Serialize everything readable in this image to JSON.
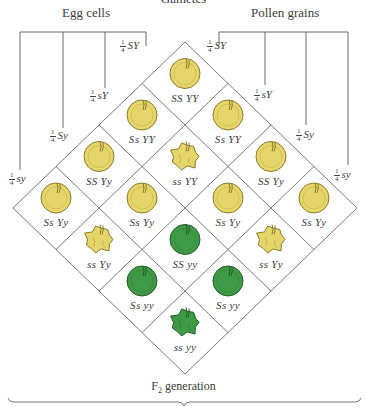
{
  "title_clipped": "Gametes",
  "headers": {
    "egg": "Egg cells",
    "pollen": "Pollen grains"
  },
  "egg_gametes": [
    {
      "fraction_num": "1",
      "fraction_den": "4",
      "genotype": "SY"
    },
    {
      "fraction_num": "1",
      "fraction_den": "4",
      "genotype": "sY"
    },
    {
      "fraction_num": "1",
      "fraction_den": "4",
      "genotype": "Sy"
    },
    {
      "fraction_num": "1",
      "fraction_den": "4",
      "genotype": "sy"
    }
  ],
  "pollen_gametes": [
    {
      "fraction_num": "1",
      "fraction_den": "4",
      "genotype": "SY"
    },
    {
      "fraction_num": "1",
      "fraction_den": "4",
      "genotype": "sY"
    },
    {
      "fraction_num": "1",
      "fraction_den": "4",
      "genotype": "Sy"
    },
    {
      "fraction_num": "1",
      "fraction_den": "4",
      "genotype": "sy"
    }
  ],
  "cells": [
    {
      "egg": 0,
      "pollen": 0,
      "genotype": "SS YY",
      "shape": "round",
      "color": "yellow"
    },
    {
      "egg": 0,
      "pollen": 1,
      "genotype": "Ss YY",
      "shape": "round",
      "color": "yellow"
    },
    {
      "egg": 0,
      "pollen": 2,
      "genotype": "SS Yy",
      "shape": "round",
      "color": "yellow"
    },
    {
      "egg": 0,
      "pollen": 3,
      "genotype": "Ss Yy",
      "shape": "round",
      "color": "yellow"
    },
    {
      "egg": 1,
      "pollen": 0,
      "genotype": "Ss YY",
      "shape": "round",
      "color": "yellow"
    },
    {
      "egg": 1,
      "pollen": 1,
      "genotype": "ss YY",
      "shape": "wrinkled",
      "color": "yellow"
    },
    {
      "egg": 1,
      "pollen": 2,
      "genotype": "Ss Yy",
      "shape": "round",
      "color": "yellow"
    },
    {
      "egg": 1,
      "pollen": 3,
      "genotype": "ss Yy",
      "shape": "wrinkled",
      "color": "yellow"
    },
    {
      "egg": 2,
      "pollen": 0,
      "genotype": "SS Yy",
      "shape": "round",
      "color": "yellow"
    },
    {
      "egg": 2,
      "pollen": 1,
      "genotype": "Ss Yy",
      "shape": "round",
      "color": "yellow"
    },
    {
      "egg": 2,
      "pollen": 2,
      "genotype": "SS yy",
      "shape": "round",
      "color": "green"
    },
    {
      "egg": 2,
      "pollen": 3,
      "genotype": "Ss yy",
      "shape": "round",
      "color": "green"
    },
    {
      "egg": 3,
      "pollen": 0,
      "genotype": "Ss Yy",
      "shape": "round",
      "color": "yellow"
    },
    {
      "egg": 3,
      "pollen": 1,
      "genotype": "ss Yy",
      "shape": "wrinkled",
      "color": "yellow"
    },
    {
      "egg": 3,
      "pollen": 2,
      "genotype": "Ss yy",
      "shape": "round",
      "color": "green"
    },
    {
      "egg": 3,
      "pollen": 3,
      "genotype": "ss yy",
      "shape": "wrinkled",
      "color": "green"
    }
  ],
  "seed_colors": {
    "yellow_fill": "#e6d66a",
    "yellow_stroke": "#8a7a2a",
    "green_fill": "#3f9a45",
    "green_stroke": "#245a28"
  },
  "footer": {
    "label_prefix": "F",
    "label_sub": "2",
    "label_suffix": " generation"
  }
}
